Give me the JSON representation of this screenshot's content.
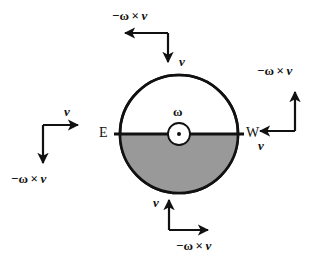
{
  "figure": {
    "background_color": "#ffffff",
    "stroke_color": "#111111",
    "shade_color": "#999999",
    "width": 326,
    "height": 266
  },
  "circle": {
    "center_x": 179,
    "center_y": 134,
    "radius": 59,
    "shaded_half": "bottom",
    "hub_radius": 11,
    "hub_dot_radius": 2
  },
  "labels": {
    "omega": "ω",
    "east": "E",
    "west": "W"
  },
  "vector_groups": [
    {
      "position": "top",
      "v_label": "v",
      "v_direction": "down",
      "coriolis_label_minus": "−",
      "coriolis_label_omega": "ω",
      "coriolis_label_times": "×",
      "coriolis_label_v": "v",
      "coriolis_direction": "left"
    },
    {
      "position": "right",
      "v_label": "v",
      "v_direction": "left",
      "coriolis_label_minus": "−",
      "coriolis_label_omega": "ω",
      "coriolis_label_times": "×",
      "coriolis_label_v": "v",
      "coriolis_direction": "up"
    },
    {
      "position": "bottom",
      "v_label": "v",
      "v_direction": "up",
      "coriolis_label_minus": "−",
      "coriolis_label_omega": "ω",
      "coriolis_label_times": "×",
      "coriolis_label_v": "v",
      "coriolis_direction": "right"
    },
    {
      "position": "left",
      "v_label": "v",
      "v_direction": "right",
      "coriolis_label_minus": "−",
      "coriolis_label_omega": "ω",
      "coriolis_label_times": "×",
      "coriolis_label_v": "v",
      "coriolis_direction": "down"
    }
  ]
}
